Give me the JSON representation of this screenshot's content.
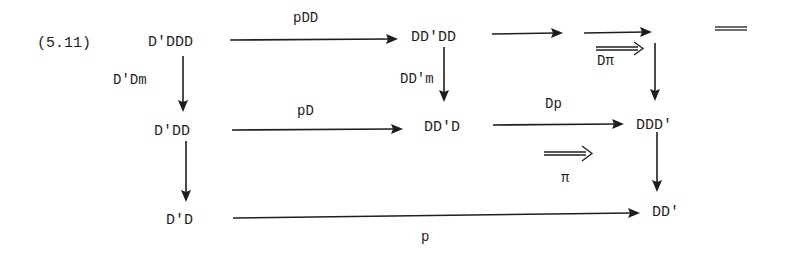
{
  "equation_number": "(5.11)",
  "nodes": {
    "n_top_left": "D'DDD",
    "n_top_mid": "DD'DD",
    "n_mid_left": "D'DD",
    "n_mid_mid": "DD'D",
    "n_mid_right": "DDD'",
    "n_bot_left": "D'D",
    "n_bot_right": "DD'"
  },
  "arrows": {
    "top_left_to_top_mid": "pDD",
    "top_left_down": "D'Dm",
    "top_mid_down": "DD'm",
    "mid_left_to_mid_mid": "pD",
    "mid_mid_to_mid_right": "Dp",
    "bot_left_to_bot_right": "p",
    "top_mid_to_blank": "",
    "blank_to_corner": "",
    "corner_down": "",
    "mid_left_down": "",
    "mid_right_down": ""
  },
  "two_cells": {
    "upper": {
      "symbol": "⟹",
      "label": "Dπ"
    },
    "lower": {
      "symbol": "⟹",
      "label": "π"
    }
  },
  "equality_mark": "="
}
